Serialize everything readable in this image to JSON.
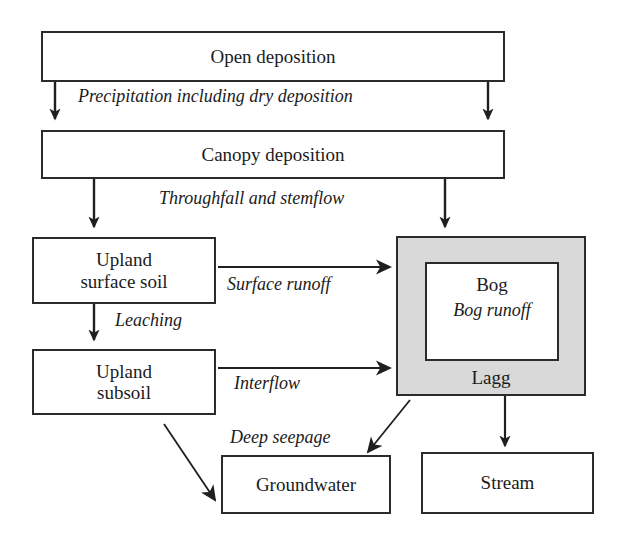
{
  "diagram": {
    "colors": {
      "stroke": "#2b2b2b",
      "lagg_fill": "#d9d9d9",
      "box_fill": "#ffffff",
      "text": "#1b1b1b",
      "background": "#ffffff"
    },
    "boxes": [
      {
        "id": "open-deposition",
        "label": "Open deposition"
      },
      {
        "id": "canopy-deposition",
        "label": "Canopy deposition"
      },
      {
        "id": "upland-surface-soil",
        "label_line1": "Upland",
        "label_line2": "surface soil"
      },
      {
        "id": "upland-subsoil",
        "label_line1": "Upland",
        "label_line2": "subsoil"
      },
      {
        "id": "lagg",
        "label": "Lagg"
      },
      {
        "id": "bog",
        "label": "Bog"
      },
      {
        "id": "groundwater",
        "label": "Groundwater"
      },
      {
        "id": "stream",
        "label": "Stream"
      }
    ],
    "flow_labels": [
      {
        "id": "precipitation",
        "text": "Precipitation including dry deposition"
      },
      {
        "id": "throughfall",
        "text": "Throughfall and stemflow"
      },
      {
        "id": "surface-runoff",
        "text": "Surface runoff"
      },
      {
        "id": "leaching",
        "text": "Leaching"
      },
      {
        "id": "interflow",
        "text": "Interflow"
      },
      {
        "id": "bog-runoff",
        "text": "Bog runoff"
      },
      {
        "id": "deep-seepage",
        "text": "Deep seepage"
      }
    ]
  }
}
